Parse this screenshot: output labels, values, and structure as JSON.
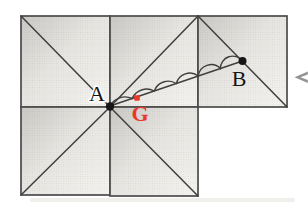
{
  "figure": {
    "labels": {
      "a": "A",
      "b": "B",
      "g": "G"
    },
    "colors": {
      "background": "#ffffff",
      "line": "#3f3f3f",
      "border": "#4a4a4a",
      "fill_shade": "#c9c8c4",
      "fill_mid": "#e6e5e1",
      "fill_base": "#f4f3ef",
      "dot": "#161616",
      "red": "#ea3829",
      "arrow_grey": "#949494",
      "shadow": "#e3e1dd"
    }
  }
}
